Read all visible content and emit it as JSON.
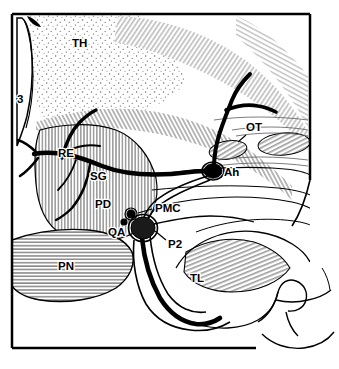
{
  "figure": {
    "kind": "anatomical-line-drawing",
    "style": {
      "line_color": "#000000",
      "hatch_color": "#555555",
      "stipple_color": "#6a6a6a",
      "background": "#ffffff",
      "frame_stroke_width": 2.5
    },
    "frame": {
      "x": 12,
      "y": 14,
      "width": 298,
      "height": 334,
      "partial_bottom_right": true
    }
  },
  "labels": [
    {
      "id": "TH",
      "text": "TH",
      "x": 72,
      "y": 47,
      "meaning": "thalamus",
      "leader": false
    },
    {
      "id": "3",
      "text": "3",
      "x": 17,
      "y": 103,
      "meaning": "third ventricle",
      "leader": false
    },
    {
      "id": "RE",
      "text": "RE",
      "x": 58,
      "y": 157,
      "meaning": "recurrent artery / perforator",
      "leader": false
    },
    {
      "id": "SG",
      "text": "SG",
      "x": 90,
      "y": 180,
      "meaning": "sulcal group",
      "leader": false
    },
    {
      "id": "PD",
      "text": "PD",
      "x": 95,
      "y": 208,
      "meaning": "peduncle",
      "leader": false
    },
    {
      "id": "QA",
      "text": "QA",
      "x": 112,
      "y": 234,
      "meaning": "quadrigeminal artery",
      "leader": false
    },
    {
      "id": "PMC",
      "text": "PMC",
      "x": 155,
      "y": 212,
      "meaning": "posterior medial choroidal artery",
      "leader": true
    },
    {
      "id": "P2",
      "text": "P2",
      "x": 168,
      "y": 245,
      "meaning": "P2 segment of posterior cerebral artery",
      "leader": true
    },
    {
      "id": "TL",
      "text": "TL",
      "x": 192,
      "y": 281,
      "meaning": "temporal lobe",
      "leader": false
    },
    {
      "id": "Ah",
      "text": "Ah",
      "x": 225,
      "y": 176,
      "meaning": "aneurysm",
      "leader": false
    },
    {
      "id": "OT",
      "text": "OT",
      "x": 247,
      "y": 131,
      "meaning": "optic tract",
      "leader": true
    }
  ],
  "structures": [
    {
      "name": "thalamus",
      "tag": "TH",
      "texture": "stipple"
    },
    {
      "name": "third-ventricle",
      "tag": "3",
      "texture": "blank"
    },
    {
      "name": "peduncle",
      "tag": "PD",
      "texture": "vertical-hatch"
    },
    {
      "name": "pons",
      "tag": "PN",
      "texture": "horizontal-hatch"
    },
    {
      "name": "temporal-lobe",
      "tag": "TL",
      "texture": "curved-hatch"
    },
    {
      "name": "optic-tract",
      "tag": "OT",
      "texture": "dense-hatch"
    }
  ],
  "vessels": [
    {
      "name": "main-trunk",
      "style": "thick-black",
      "note": "runs horizontally from left branch point to aneurysm"
    },
    {
      "name": "superior-branch",
      "style": "thick-black",
      "note": "Y-branch ascending superiorly above aneurysm"
    },
    {
      "name": "p2-segment",
      "style": "thick-black",
      "note": "descends inferiorly from perforator cluster"
    },
    {
      "name": "pmc-artery",
      "style": "thin-black",
      "note": "posterior medial choroidal, arises near cluster"
    }
  ],
  "markers": [
    {
      "name": "aneurysm-dome",
      "tag": "Ah",
      "cx": 213,
      "cy": 171,
      "rx": 9,
      "ry": 7,
      "fill": "#000000",
      "ring": true
    },
    {
      "name": "pmc-cluster-large",
      "tag": "PMC",
      "cx": 143,
      "cy": 228,
      "rx": 12,
      "ry": 11,
      "fill": "#1a1a1a",
      "ring": true
    },
    {
      "name": "pmc-cluster-mid",
      "tag": "PMC",
      "cx": 131,
      "cy": 214,
      "rx": 4.5,
      "ry": 4.5,
      "fill": "#000000",
      "ring": true
    },
    {
      "name": "pmc-cluster-small",
      "tag": "QA",
      "cx": 124,
      "cy": 222,
      "rx": 3.5,
      "ry": 3.5,
      "fill": "#000000",
      "ring": false
    }
  ],
  "pn_label": {
    "id": "PN",
    "text": "PN",
    "x": 62,
    "y": 268,
    "meaning": "pons"
  }
}
